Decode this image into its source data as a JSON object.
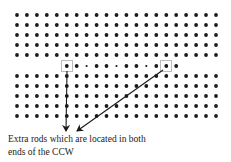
{
  "figure": {
    "type": "rod-array-schematic",
    "grid": {
      "columns": 21,
      "x_start": 17,
      "x_step": 9.95,
      "rows_y": [
        15,
        25,
        35,
        45,
        55,
        66,
        76,
        86,
        96,
        106,
        116
      ],
      "special_row_index": 5,
      "dot_radius": 1.9,
      "small_dot_radius": 1.1,
      "special_row_pattern": [
        "none",
        "none",
        "none",
        "none",
        "none",
        "big",
        "big",
        "small",
        "big",
        "big",
        "small",
        "big",
        "big",
        "small",
        "big",
        "big",
        "big",
        "none",
        "none",
        "none",
        "none"
      ]
    },
    "highlight_boxes": [
      {
        "name": "left-extra-rod-box",
        "cx": 67,
        "cy": 66
      },
      {
        "name": "right-extra-rod-box",
        "cx": 166,
        "cy": 66
      }
    ],
    "arrows": [
      {
        "name": "left-arrow",
        "from": [
          67,
          71
        ],
        "to": [
          66,
          131
        ]
      },
      {
        "name": "right-arrow",
        "from": [
          163,
          70
        ],
        "to": [
          77,
          131
        ]
      }
    ],
    "caption": {
      "line1": "Extra rods which are located in both",
      "line2": "ends of the CCW"
    },
    "colors": {
      "dot": "#1a1a1a",
      "arrow": "#1a1a1a",
      "box": "#555555"
    }
  }
}
